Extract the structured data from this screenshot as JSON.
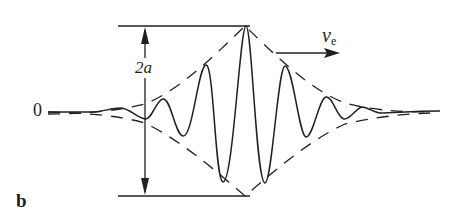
{
  "figure": {
    "panel_label": "b",
    "origin_label": "0",
    "amplitude_label": "2a",
    "velocity_label": {
      "symbol": "v",
      "subscript": "e"
    }
  },
  "colors": {
    "stroke": "#231f20",
    "background": "#ffffff"
  }
}
